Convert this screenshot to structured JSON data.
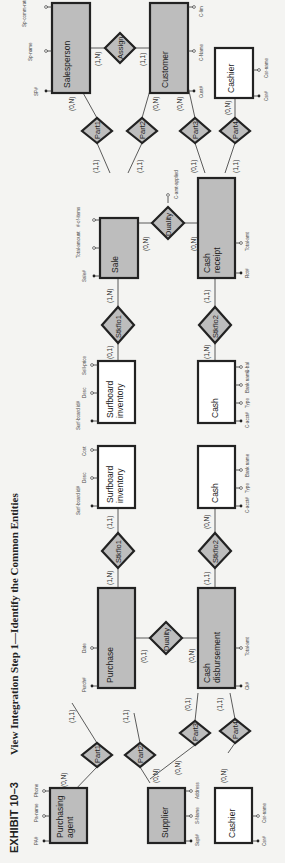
{
  "title": {
    "exhibit": "EXHIBIT 10–3",
    "text": "View Integration Step 1—Identify the Common Entities"
  },
  "entities": {
    "purchasing_agent": {
      "label1": "Purchasing",
      "label2": "agent",
      "attrs": [
        "PA#",
        "Pa-name",
        "Phone"
      ]
    },
    "supplier": {
      "label1": "Supplier",
      "label2": "",
      "attrs": [
        "Supl#",
        "S-Name",
        "Address"
      ]
    },
    "cashier_left": {
      "label1": "Cashier",
      "label2": "",
      "attrs": [
        "Csr#",
        "Csr-name"
      ]
    },
    "purchase": {
      "label1": "Purchase",
      "label2": "",
      "attrs": [
        "Purch#",
        "Date"
      ]
    },
    "cash_disbursement": {
      "label1": "Cash",
      "label2": "disbursement",
      "attrs": [
        "Ck#",
        "Total-amt"
      ]
    },
    "surfboard_inv_left": {
      "label1": "Surfboard",
      "label2": "inventory",
      "attrs": [
        "Surf-board id#",
        "Desc",
        "Cost"
      ]
    },
    "cash_left": {
      "label1": "Cash",
      "label2": "",
      "attrs": [
        "C-acct#",
        "Type",
        "Bank name"
      ]
    },
    "surfboard_inv_right": {
      "label1": "Surfboard",
      "label2": "inventory",
      "attrs": [
        "Surf-board id#",
        "Desc",
        "Sell-price"
      ]
    },
    "cash_right": {
      "label1": "Cash",
      "label2": "",
      "attrs": [
        "C-acct#",
        "Type",
        "Bank name",
        "C-bal"
      ]
    },
    "sale": {
      "label1": "Sale",
      "label2": "",
      "attrs": [
        "Sale#",
        "Total-amount",
        "#-of-items"
      ]
    },
    "cash_receipt": {
      "label1": "Cash",
      "label2": "receipt",
      "attrs": [
        "Rct#",
        "Total-amt"
      ]
    },
    "salesperson": {
      "label1": "Salesperson",
      "label2": "",
      "attrs": [
        "SP#",
        "Sp-name",
        "Sp-comm-rate"
      ]
    },
    "customer": {
      "label1": "Customer",
      "label2": "",
      "attrs": [
        "Cust#",
        "C-Name",
        "C-lim"
      ]
    },
    "cashier_right": {
      "label1": "Cashier",
      "label2": "",
      "attrs": [
        "Csr#",
        "Csr-name"
      ]
    }
  },
  "relationships": {
    "left_part1": {
      "label": "Part1",
      "card_a": "(0,N)",
      "card_b": "(1,1)"
    },
    "left_part2": {
      "label": "Part2",
      "card_a": "(0,N)",
      "card_b": "(1,1)"
    },
    "left_part3": {
      "label": "Part3",
      "card_a": "(0,N)",
      "card_b": "(0,1)"
    },
    "left_part4": {
      "label": "Part4",
      "card_a": "(0,N)",
      "card_b": "(1,1)"
    },
    "left_duality": {
      "label": "Duality",
      "card_a": "(0,1)",
      "card_b": "(0,N)"
    },
    "left_stkflo1": {
      "label": "Stkflo1",
      "card_a": "(1,N)",
      "card_b": "(1,1)"
    },
    "left_stkflo2": {
      "label": "Stkflo2",
      "card_a": "(1,1)",
      "card_b": "(0,N)"
    },
    "right_stkflo1": {
      "label": "Stkflo1",
      "card_a": "(0,1)",
      "card_b": "(1,N)"
    },
    "right_stkflo2": {
      "label": "Stkflo2",
      "card_a": "(1,N)",
      "card_b": "(1,1)"
    },
    "right_duality": {
      "label": "Duality",
      "card_a": "(0,N)",
      "card_b": "(0,N)",
      "attr": "C-amt-applied"
    },
    "right_part1": {
      "label": "Part1",
      "card_a": "(1,1)",
      "card_b": "(0,N)"
    },
    "right_part2": {
      "label": "Part2",
      "card_a": "(1,1)",
      "card_b": "(0,N)"
    },
    "right_part3": {
      "label": "Part3",
      "card_a": "(0,1)",
      "card_b": "(0,N)"
    },
    "right_part4": {
      "label": "Part4",
      "card_a": "(1,1)",
      "card_b": "(0,N)"
    },
    "assign": {
      "label": "Assign",
      "card_a": "(1,N)",
      "card_b": "(1,1)"
    }
  },
  "colors": {
    "shaded_entity": "#bdbdbd",
    "plain_entity": "#ffffff",
    "stroke": "#222222",
    "background": "#f4f4f2"
  }
}
